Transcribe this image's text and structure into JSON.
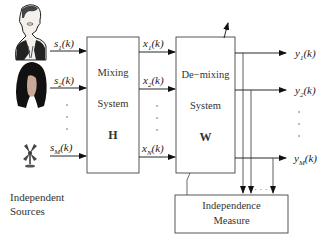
{
  "sources": [
    {
      "label_base": "s",
      "label_sub": "1",
      "label_suffix": "(k)",
      "icon": "man-speaker-icon"
    },
    {
      "label_base": "s",
      "label_sub": "2",
      "label_suffix": "(k)",
      "icon": "woman-speaker-icon"
    },
    {
      "label_base": "s",
      "label_sub": "M",
      "label_suffix": "(k)",
      "icon": "fan-noise-icon"
    }
  ],
  "sources_caption": [
    "Independent",
    "Sources"
  ],
  "mixing_system": {
    "line1": "Mixing",
    "line2": "System",
    "symbol": "H"
  },
  "mixed_signals": [
    {
      "label_base": "x",
      "label_sub": "1",
      "label_suffix": "(k)"
    },
    {
      "label_base": "x",
      "label_sub": "2",
      "label_suffix": "(k)"
    },
    {
      "label_base": "x",
      "label_sub": "N",
      "label_suffix": "(k)"
    }
  ],
  "demixing_system": {
    "line1": "De−mixing",
    "line2": "System",
    "symbol": "W"
  },
  "outputs": [
    {
      "label_base": "y",
      "label_sub": "1",
      "label_suffix": "(k)"
    },
    {
      "label_base": "y",
      "label_sub": "2",
      "label_suffix": "(k)"
    },
    {
      "label_base": "y",
      "label_sub": "M",
      "label_suffix": "(k)"
    }
  ],
  "independence_measure": {
    "line1": "Independence",
    "line2": "Measure"
  },
  "ellipsis_dots": "·  ·  ·"
}
